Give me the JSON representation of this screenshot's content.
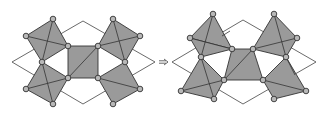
{
  "colors": {
    "polyhedron_fill": "#9a9a9a",
    "atom_fill": "#b8b8b8",
    "outline": "#333333",
    "background": "#ffffff"
  },
  "figures": [
    {
      "name": "left-structure",
      "cell": [
        [
          12,
          62
        ],
        [
          83,
          21
        ],
        [
          155,
          62
        ],
        [
          83,
          104
        ]
      ],
      "polys": [
        [
          [
            53,
            19
          ],
          [
            68,
            46
          ],
          [
            42,
            62
          ],
          [
            26,
            36
          ]
        ],
        [
          [
            42,
            62
          ],
          [
            68,
            78
          ],
          [
            53,
            104
          ],
          [
            26,
            89
          ]
        ],
        [
          [
            68,
            46
          ],
          [
            98,
            46
          ],
          [
            98,
            78
          ],
          [
            68,
            78
          ]
        ],
        [
          [
            113,
            19
          ],
          [
            140,
            36
          ],
          [
            125,
            62
          ],
          [
            98,
            46
          ]
        ],
        [
          [
            98,
            78
          ],
          [
            125,
            62
          ],
          [
            140,
            89
          ],
          [
            113,
            104
          ]
        ]
      ],
      "edges": [
        [
          [
            26,
            36
          ],
          [
            68,
            46
          ]
        ],
        [
          [
            53,
            19
          ],
          [
            42,
            62
          ]
        ],
        [
          [
            42,
            62
          ],
          [
            53,
            104
          ]
        ],
        [
          [
            26,
            89
          ],
          [
            68,
            78
          ]
        ],
        [
          [
            68,
            78
          ],
          [
            98,
            46
          ]
        ],
        [
          [
            113,
            19
          ],
          [
            125,
            62
          ]
        ],
        [
          [
            98,
            46
          ],
          [
            140,
            36
          ]
        ],
        [
          [
            98,
            78
          ],
          [
            140,
            89
          ]
        ]
      ],
      "atoms": [
        [
          53,
          19
        ],
        [
          26,
          36
        ],
        [
          68,
          46
        ],
        [
          42,
          62
        ],
        [
          68,
          78
        ],
        [
          26,
          89
        ],
        [
          53,
          104
        ],
        [
          98,
          46
        ],
        [
          98,
          78
        ],
        [
          113,
          19
        ],
        [
          140,
          36
        ],
        [
          125,
          62
        ],
        [
          140,
          89
        ],
        [
          113,
          104
        ]
      ]
    },
    {
      "name": "right-structure",
      "cell": [
        [
          172,
          62
        ],
        [
          243,
          20
        ],
        [
          316,
          62
        ],
        [
          243,
          104
        ]
      ],
      "polys": [
        [
          [
            213,
            14
          ],
          [
            232,
            49
          ],
          [
            190,
            38
          ]
        ],
        [
          [
            190,
            38
          ],
          [
            232,
            49
          ],
          [
            201,
            57
          ]
        ],
        [
          [
            201,
            57
          ],
          [
            224,
            80
          ],
          [
            214,
            99
          ],
          [
            181,
            91
          ]
        ],
        [
          [
            232,
            49
          ],
          [
            253,
            49
          ],
          [
            263,
            80
          ],
          [
            224,
            80
          ]
        ],
        [
          [
            274,
            14
          ],
          [
            297,
            38
          ],
          [
            286,
            57
          ],
          [
            253,
            49
          ]
        ],
        [
          [
            286,
            57
          ],
          [
            306,
            91
          ],
          [
            274,
            99
          ],
          [
            263,
            80
          ]
        ]
      ],
      "edges": [
        [
          [
            201,
            57
          ],
          [
            214,
            99
          ]
        ],
        [
          [
            181,
            91
          ],
          [
            224,
            80
          ]
        ],
        [
          [
            224,
            80
          ],
          [
            253,
            49
          ]
        ],
        [
          [
            274,
            14
          ],
          [
            286,
            57
          ]
        ],
        [
          [
            253,
            49
          ],
          [
            297,
            38
          ]
        ],
        [
          [
            263,
            80
          ],
          [
            306,
            91
          ]
        ],
        [
          [
            286,
            57
          ],
          [
            295,
            75
          ]
        ],
        [
          [
            213,
            14
          ],
          [
            201,
            57
          ]
        ],
        [
          [
            222,
            36
          ],
          [
            230,
            31
          ]
        ]
      ],
      "atoms": [
        [
          213,
          14
        ],
        [
          190,
          38
        ],
        [
          232,
          49
        ],
        [
          201,
          57
        ],
        [
          224,
          80
        ],
        [
          181,
          91
        ],
        [
          214,
          99
        ],
        [
          253,
          49
        ],
        [
          263,
          80
        ],
        [
          274,
          14
        ],
        [
          297,
          38
        ],
        [
          286,
          57
        ],
        [
          306,
          91
        ],
        [
          274,
          99
        ]
      ]
    }
  ],
  "arrow": {
    "symbol": "⇒",
    "x1": 159,
    "x2": 168,
    "y": 62
  }
}
